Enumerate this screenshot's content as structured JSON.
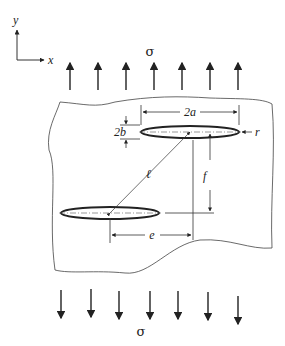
{
  "figure": {
    "type": "diagram",
    "axes": {
      "x_label": "x",
      "y_label": "y"
    },
    "stress_top": "σ",
    "stress_bottom": "σ",
    "dimensions": {
      "crack_length": "2a",
      "crack_width": "2b",
      "tip_radius": "r",
      "center_distance": "ℓ",
      "vertical_offset": "f",
      "horizontal_offset": "e"
    },
    "arrow_count_top": 7,
    "arrow_count_bottom": 7
  }
}
